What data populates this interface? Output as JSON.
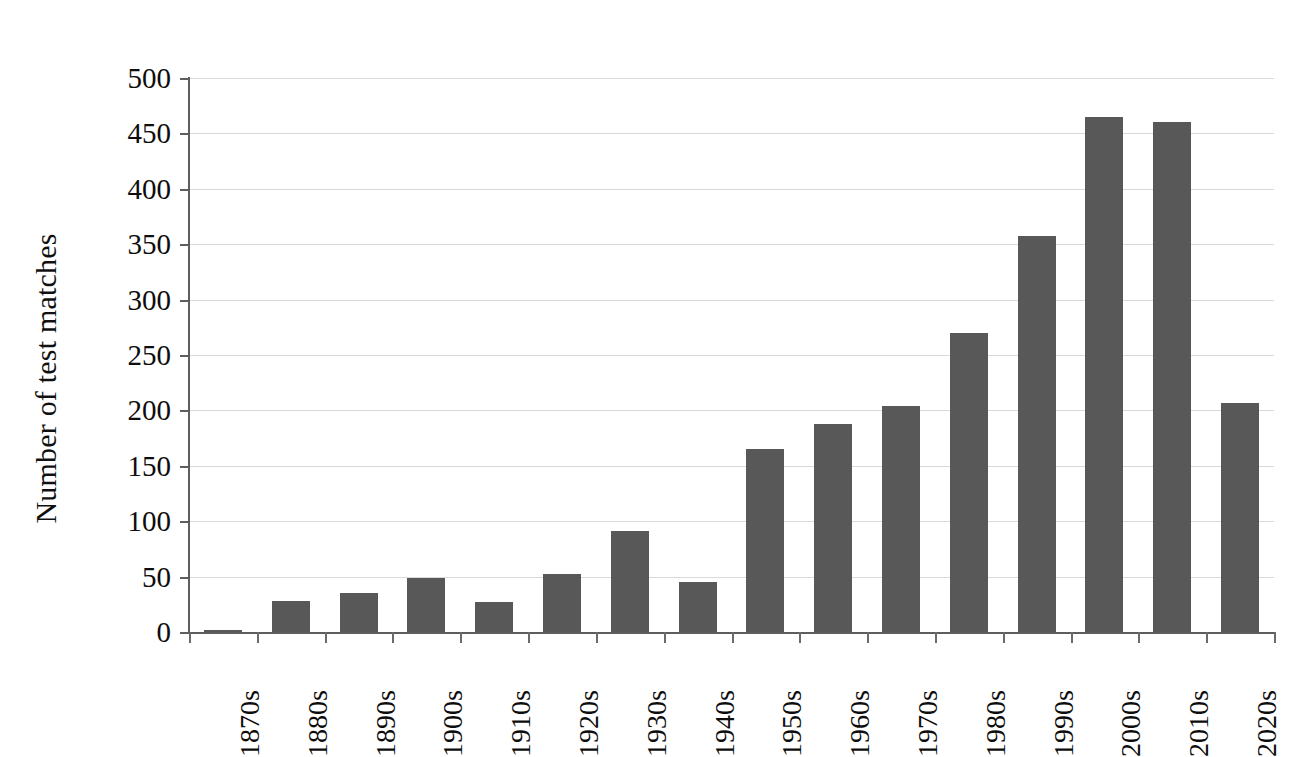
{
  "chart_data": {
    "type": "bar",
    "title": "",
    "xlabel": "",
    "ylabel": "Number of test matches",
    "categories": [
      "1870s",
      "1880s",
      "1890s",
      "1900s",
      "1910s",
      "1920s",
      "1930s",
      "1940s",
      "1950s",
      "1960s",
      "1970s",
      "1980s",
      "1990s",
      "2000s",
      "2010s",
      "2020s"
    ],
    "values": [
      2,
      28,
      35,
      49,
      27,
      52,
      91,
      45,
      165,
      188,
      204,
      270,
      357,
      465,
      460,
      207
    ],
    "ylim": [
      0,
      500
    ],
    "ytick_labels": [
      "500",
      "450",
      "400",
      "350",
      "300",
      "250",
      "200",
      "150",
      "100",
      "50",
      "0"
    ],
    "ytick_values": [
      500,
      450,
      400,
      350,
      300,
      250,
      200,
      150,
      100,
      50,
      0
    ],
    "grid": true,
    "legend": "none",
    "bar_color": "#585858",
    "grid_color": "#d9d9d9",
    "axis_color": "#5e5e5e"
  }
}
